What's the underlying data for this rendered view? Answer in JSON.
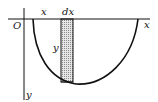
{
  "diagram": {
    "type": "area-under-curve strip",
    "labels": {
      "origin": "O",
      "x_top": "x",
      "dx": "dx",
      "x_axis": "x",
      "y_inner": "y",
      "y_axis": "y"
    },
    "colors": {
      "stroke": "#111111",
      "strip_fill": "#c8c8c8",
      "background": "#ffffff"
    }
  }
}
